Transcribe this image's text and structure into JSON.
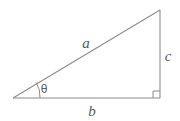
{
  "figure": {
    "type": "right-triangle-diagram",
    "background_color": "#ffffff",
    "stroke_color": "#8c8c8c",
    "text_color": "#5a5a5a",
    "stroke_width": 1,
    "vertices": {
      "left": {
        "x": 13,
        "y": 98
      },
      "bottom_right": {
        "x": 160,
        "y": 98
      },
      "top_right": {
        "x": 160,
        "y": 10
      }
    },
    "labels": {
      "hypotenuse": "a",
      "base": "b",
      "vertical": "c",
      "angle": "θ"
    },
    "label_positions": {
      "hypotenuse": {
        "x": 86,
        "y": 48
      },
      "base": {
        "x": 92,
        "y": 116
      },
      "vertical": {
        "x": 168,
        "y": 61
      },
      "angle": {
        "x": 44,
        "y": 93
      }
    },
    "markers": {
      "right_angle": {
        "name": "right-angle-square",
        "corner_x": 160,
        "corner_y": 98,
        "size": 7
      },
      "angle_arc": {
        "name": "theta-angle-arc",
        "radius": 27
      }
    }
  }
}
